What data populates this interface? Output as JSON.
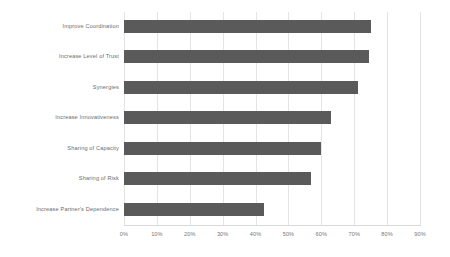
{
  "chart_data": {
    "type": "bar",
    "orientation": "horizontal",
    "title": "",
    "subtitle": "",
    "xlabel": "",
    "ylabel": "",
    "categories": [
      "Improve Coordination",
      "Increase Level of Trust",
      "Synergies",
      "Increase Innovativeness",
      "Sharing of Capacity",
      "Sharing of Risk",
      "Increase Partner's Dependence"
    ],
    "values": [
      75,
      74.5,
      71,
      63,
      60,
      57,
      42.5
    ],
    "value_unit": "%",
    "xlim": [
      0,
      90
    ],
    "xticks": [
      0,
      10,
      20,
      30,
      40,
      50,
      60,
      70,
      80,
      90
    ],
    "xtick_labels": [
      "0%",
      "10%",
      "20%",
      "30%",
      "40%",
      "50%",
      "60%",
      "70%",
      "80%",
      "90%"
    ],
    "grid": "vertical",
    "legend": null,
    "series": [
      {
        "name": "",
        "values": [
          75,
          74.5,
          71,
          63,
          60,
          57,
          42.5
        ]
      }
    ],
    "colors": {
      "bar": "#5a5a5a",
      "gridline": "#e4e4e4",
      "axis": "#d9d9d9",
      "tick_label": "#777777",
      "category_label": "#6b6b6b",
      "background": "#ffffff"
    }
  }
}
